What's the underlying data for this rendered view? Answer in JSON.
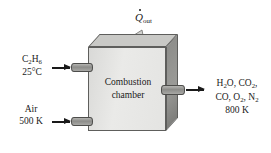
{
  "figure": {
    "type": "thermodynamics-process-diagram"
  },
  "chamber": {
    "label_line1": "Combustion",
    "label_line2": "chamber",
    "front_color": "#e4e4e2",
    "top_color": "#c9c9c6",
    "side_color": "#8e8e8b",
    "edge_color": "#5e5e5c"
  },
  "heat_out": {
    "symbol": "Q",
    "subscript": "out",
    "direction": "up-right",
    "arrow_color": "#d6d6d3"
  },
  "inlets": [
    {
      "id": "fuel",
      "substance": "C",
      "sub1": "2",
      "element2": "H",
      "sub2": "6",
      "temperature": "25°C"
    },
    {
      "id": "air",
      "substance": "Air",
      "temperature": "500 K"
    }
  ],
  "outlet": {
    "id": "products",
    "line1_a": "H",
    "line1_a_sub": "2",
    "line1_b": "O, CO",
    "line1_b_sub": "2",
    "line1_c": ",",
    "line2_a": "CO, O",
    "line2_a_sub": "2",
    "line2_b": ", N",
    "line2_b_sub": "2",
    "temperature": "800 K"
  },
  "colors": {
    "background": "#ffffff",
    "text": "#1a1a1a",
    "pipe": "#8d8d8a"
  }
}
